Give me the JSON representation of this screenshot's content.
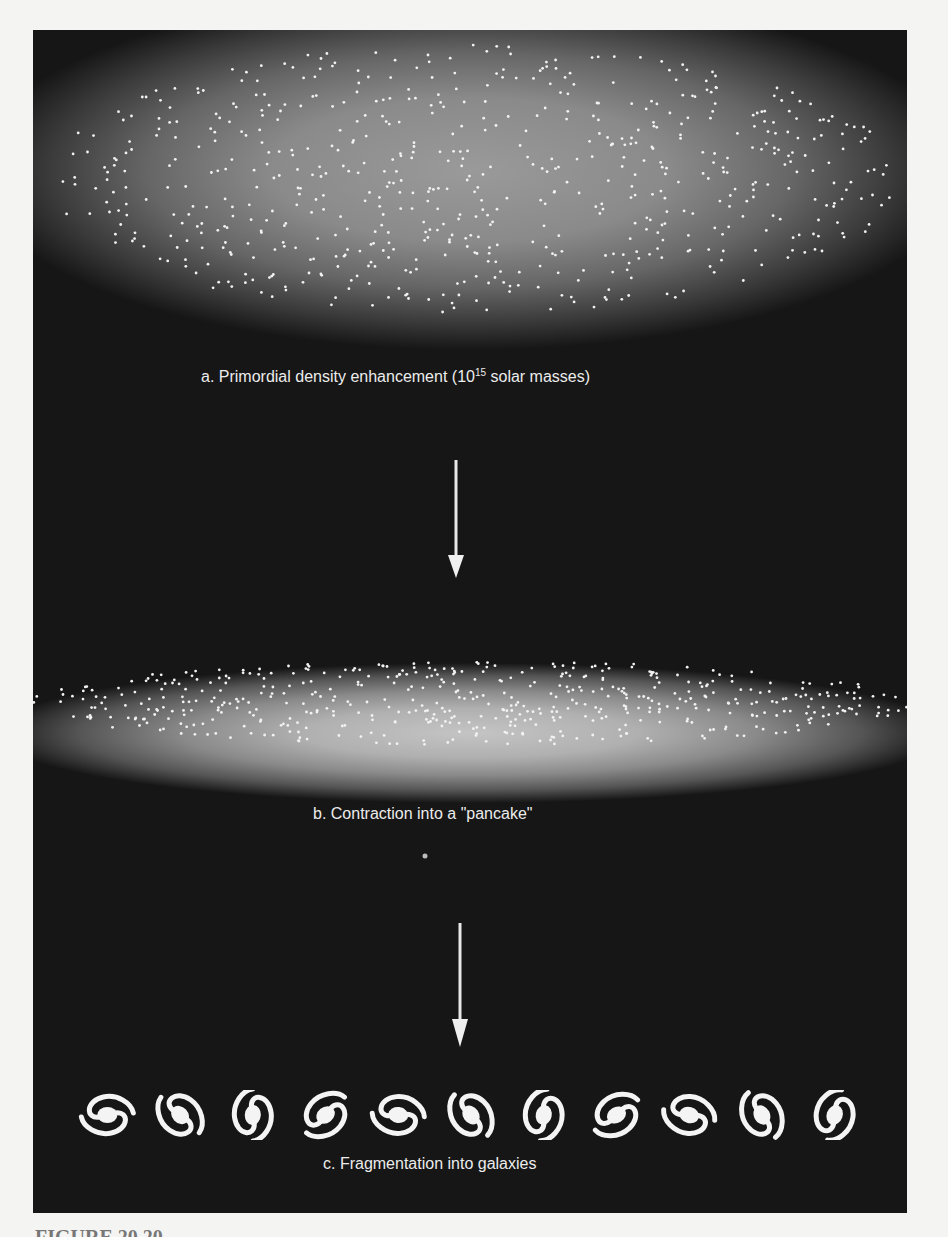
{
  "figure": {
    "panels": [
      {
        "id": "a",
        "label": "a.  Primordial density enhancement (10",
        "sup": "15",
        "label_suffix": " solar masses)"
      },
      {
        "id": "b",
        "label": "b.  Contraction into a \"pancake\""
      },
      {
        "id": "c",
        "label": "c.  Fragmentation into galaxies"
      }
    ],
    "arrows": [
      {
        "from": "a",
        "to": "b",
        "icon": "arrow-down-icon"
      },
      {
        "from": "b",
        "to": "c",
        "icon": "arrow-down-icon"
      }
    ],
    "galaxy_count": 11,
    "caption_fragment": "FIGURE 20.20"
  },
  "colors": {
    "background": "#161616",
    "page": "#f4f4f2",
    "text": "#ececec",
    "cloud_a": "#9a9a9a",
    "cloud_b": "#c4c4c4"
  }
}
